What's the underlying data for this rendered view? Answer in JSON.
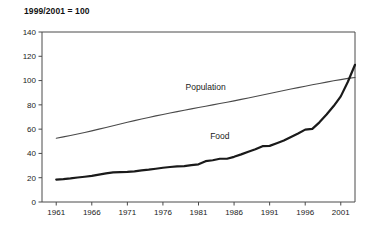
{
  "chart_data": {
    "type": "line",
    "title": "1999/2001 = 100",
    "xlabel": "",
    "ylabel": "",
    "xlim": [
      1959,
      2003
    ],
    "ylim": [
      0,
      140
    ],
    "yticks": [
      0,
      20,
      40,
      60,
      80,
      100,
      120,
      140
    ],
    "xticks": [
      1961,
      1966,
      1971,
      1976,
      1981,
      1986,
      1991,
      1996,
      2001
    ],
    "grid": false,
    "legend_position": "inline-annotation",
    "annotations": [
      {
        "text": "Population",
        "x": 1982,
        "y": 92
      },
      {
        "text": "Food",
        "x": 1984,
        "y": 52
      }
    ],
    "x": [
      1961,
      1962,
      1963,
      1964,
      1965,
      1966,
      1967,
      1968,
      1969,
      1970,
      1971,
      1972,
      1973,
      1974,
      1975,
      1976,
      1977,
      1978,
      1979,
      1980,
      1981,
      1982,
      1983,
      1984,
      1985,
      1986,
      1987,
      1988,
      1989,
      1990,
      1991,
      1992,
      1993,
      1994,
      1995,
      1996,
      1997,
      1998,
      1999,
      2000,
      2001,
      2002,
      2003
    ],
    "series": [
      {
        "name": "Population",
        "color": "#4a4a4a",
        "values": [
          52.5,
          53.6,
          54.8,
          56.0,
          57.3,
          58.6,
          60.0,
          61.4,
          62.8,
          64.2,
          65.6,
          67.0,
          68.3,
          69.6,
          70.9,
          72.1,
          73.3,
          74.4,
          75.6,
          76.7,
          77.8,
          78.9,
          80.0,
          81.1,
          82.2,
          83.3,
          84.5,
          85.7,
          86.9,
          88.1,
          89.4,
          90.6,
          91.8,
          93.0,
          94.2,
          95.3,
          96.5,
          97.6,
          98.7,
          99.8,
          100.8,
          101.8,
          102.5
        ]
      },
      {
        "name": "Food",
        "color": "#1a1a1a",
        "values": [
          18.5,
          18.8,
          19.4,
          20.2,
          20.8,
          21.5,
          22.6,
          23.6,
          24.4,
          24.6,
          24.8,
          25.2,
          26.0,
          26.6,
          27.4,
          28.2,
          28.8,
          29.4,
          29.6,
          30.4,
          31.0,
          33.6,
          34.4,
          35.6,
          35.6,
          37.2,
          39.2,
          41.4,
          43.4,
          46.0,
          46.2,
          48.4,
          50.6,
          53.6,
          56.4,
          59.6,
          60.2,
          65.6,
          72.0,
          79.0,
          87.0,
          99.0,
          113.0
        ]
      }
    ]
  }
}
